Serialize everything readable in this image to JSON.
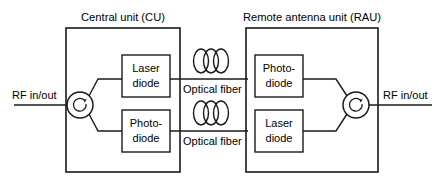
{
  "diagram": {
    "stroke_color": "#1a1a1a",
    "background_color": "#ffffff",
    "units": [
      {
        "id": "cu",
        "title": "Central unit (CU)"
      },
      {
        "id": "rau",
        "title": "Remote antenna unit (RAU)"
      }
    ],
    "blocks": [
      {
        "id": "cu-laser",
        "line1": "Laser",
        "line2": "diode"
      },
      {
        "id": "cu-photo",
        "line1": "Photo-",
        "line2": "diode"
      },
      {
        "id": "rau-photo",
        "line1": "Photo-",
        "line2": "diode"
      },
      {
        "id": "rau-laser",
        "line1": "Laser",
        "line2": "diode"
      }
    ],
    "fibers": [
      {
        "id": "fiber-upper",
        "label": "Optical fiber"
      },
      {
        "id": "fiber-lower",
        "label": "Optical fiber"
      }
    ],
    "ports": [
      {
        "id": "rf-left",
        "label": "RF in/out"
      },
      {
        "id": "rf-right",
        "label": "RF in/out"
      }
    ],
    "circulators": [
      {
        "id": "circulator-left",
        "symbol": "clockwise-arrow"
      },
      {
        "id": "circulator-right",
        "symbol": "clockwise-arrow"
      }
    ]
  }
}
